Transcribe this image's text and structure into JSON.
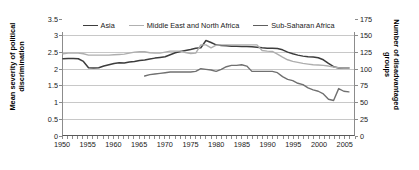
{
  "chart_data": {
    "type": "line",
    "title": "",
    "subtitle": "",
    "xlabel": "",
    "ylabel": "Mean severity of political discrimination",
    "y2label": "Number of disadvantaged groups",
    "xlim": [
      1950,
      2007
    ],
    "ylim": [
      0,
      3.5
    ],
    "y2lim": [
      0,
      175
    ],
    "xticks": [
      1950,
      1955,
      1960,
      1965,
      1970,
      1975,
      1980,
      1985,
      1990,
      1995,
      2000,
      2005
    ],
    "xtick_labels": [
      "1950",
      "1955",
      "1960",
      "1965",
      "1970",
      "1975",
      "1980",
      "1985",
      "1990",
      "1995",
      "2000",
      "2005"
    ],
    "yticks": [
      0,
      0.5,
      1,
      1.5,
      2,
      2.5,
      3,
      3.5
    ],
    "ytick_labels": [
      "0",
      "0.5",
      "1",
      "1.5",
      "2",
      "2.5",
      "3",
      "3.5"
    ],
    "y2ticks": [
      0,
      25,
      50,
      75,
      100,
      125,
      150,
      175
    ],
    "y2tick_labels": [
      "0",
      "25",
      "50",
      "75",
      "100",
      "125",
      "150",
      "175"
    ],
    "grid": true,
    "grid_axis": "y",
    "legend_position": "top-inside",
    "series": [
      {
        "name": "Asia",
        "color": "#3d3d3d",
        "width": 1.5,
        "axis": "left",
        "x": [
          1950,
          1951,
          1952,
          1953,
          1954,
          1955,
          1956,
          1957,
          1958,
          1959,
          1960,
          1961,
          1962,
          1963,
          1964,
          1965,
          1966,
          1967,
          1968,
          1969,
          1970,
          1971,
          1972,
          1973,
          1974,
          1975,
          1976,
          1977,
          1978,
          1979,
          1980,
          1981,
          1982,
          1983,
          1984,
          1985,
          1986,
          1987,
          1988,
          1989,
          1990,
          1991,
          1992,
          1993,
          1994,
          1995,
          1996,
          1997,
          1998,
          1999,
          2000,
          2001,
          2002,
          2003,
          2004,
          2005,
          2006
        ],
        "values": [
          2.3,
          2.31,
          2.31,
          2.3,
          2.22,
          2.03,
          2.02,
          2.03,
          2.08,
          2.12,
          2.16,
          2.18,
          2.17,
          2.2,
          2.22,
          2.25,
          2.26,
          2.29,
          2.32,
          2.34,
          2.36,
          2.42,
          2.48,
          2.52,
          2.55,
          2.58,
          2.62,
          2.63,
          2.85,
          2.79,
          2.72,
          2.7,
          2.69,
          2.68,
          2.68,
          2.67,
          2.67,
          2.66,
          2.65,
          2.63,
          2.62,
          2.62,
          2.61,
          2.57,
          2.5,
          2.45,
          2.41,
          2.38,
          2.36,
          2.35,
          2.33,
          2.27,
          2.16,
          2.06,
          2.02,
          2.02,
          2.02
        ]
      },
      {
        "name": "Middle East and North Africa",
        "color": "#aeaeae",
        "width": 1.4,
        "axis": "left",
        "x": [
          1950,
          1951,
          1952,
          1953,
          1954,
          1955,
          1956,
          1957,
          1958,
          1959,
          1960,
          1961,
          1962,
          1963,
          1964,
          1965,
          1966,
          1967,
          1968,
          1969,
          1970,
          1971,
          1972,
          1973,
          1974,
          1975,
          1976,
          1977,
          1978,
          1979,
          1980,
          1981,
          1982,
          1983,
          1984,
          1985,
          1986,
          1987,
          1988,
          1989,
          1990,
          1991,
          1992,
          1993,
          1994,
          1995,
          1996,
          1997,
          1998,
          1999,
          2000,
          2001,
          2002,
          2003,
          2004,
          2005,
          2006
        ],
        "values": [
          2.45,
          2.47,
          2.47,
          2.47,
          2.45,
          2.41,
          2.41,
          2.41,
          2.41,
          2.41,
          2.42,
          2.43,
          2.44,
          2.47,
          2.5,
          2.51,
          2.51,
          2.48,
          2.47,
          2.47,
          2.5,
          2.53,
          2.53,
          2.53,
          2.49,
          2.46,
          2.47,
          2.72,
          2.72,
          2.63,
          2.71,
          2.72,
          2.72,
          2.72,
          2.72,
          2.72,
          2.72,
          2.72,
          2.72,
          2.55,
          2.53,
          2.52,
          2.44,
          2.35,
          2.27,
          2.22,
          2.19,
          2.16,
          2.14,
          2.12,
          2.11,
          2.1,
          2.08,
          2.05,
          2.03,
          2.02,
          2.02
        ]
      },
      {
        "name": "Sub-Saharan Africa",
        "color": "#707070",
        "width": 1.4,
        "axis": "right",
        "x": [
          1966,
          1967,
          1968,
          1969,
          1970,
          1971,
          1972,
          1973,
          1974,
          1975,
          1976,
          1977,
          1978,
          1979,
          1980,
          1981,
          1982,
          1983,
          1984,
          1985,
          1986,
          1987,
          1988,
          1989,
          1990,
          1991,
          1992,
          1993,
          1994,
          1995,
          1996,
          1997,
          1998,
          1999,
          2000,
          2001,
          2002,
          2003,
          2004,
          2005,
          2006
        ],
        "values": [
          89,
          91,
          92,
          93,
          94,
          95,
          95,
          95,
          95,
          95,
          96,
          100,
          99,
          98,
          96,
          99,
          103,
          105,
          105,
          106,
          104,
          96,
          96,
          96,
          96,
          96,
          94,
          88,
          84,
          82,
          78,
          76,
          71,
          68,
          66,
          62,
          54,
          52,
          70,
          66,
          65
        ]
      }
    ]
  },
  "axes": {
    "left_title": "Mean severity of political discrimination",
    "right_title": "Number of disadvantaged groups"
  },
  "legend": {
    "items": [
      {
        "label": "Asia",
        "color": "#3d3d3d",
        "width": "1.6px"
      },
      {
        "label": "Middle East and North Africa",
        "color": "#b0b0b0",
        "width": "1.3px"
      },
      {
        "label": "Sub-Saharan Africa",
        "color": "#5e5e5e",
        "width": "1.3px"
      }
    ]
  }
}
